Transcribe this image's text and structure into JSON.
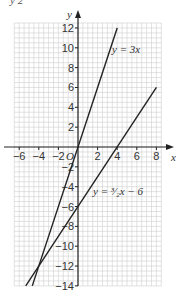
{
  "header_fragment": "y   2",
  "chart_data": {
    "type": "line",
    "title": "",
    "xlabel": "x",
    "ylabel": "y",
    "xlim": [
      -6,
      8.5
    ],
    "ylim": [
      -14,
      12.5
    ],
    "grid": true,
    "x_ticks": [
      -6,
      -4,
      -2,
      2,
      4,
      6,
      8
    ],
    "y_ticks": [
      12,
      10,
      8,
      6,
      4,
      2,
      -2,
      -4,
      -6,
      -8,
      -10,
      -12,
      -14
    ],
    "origin_label": "O",
    "series": [
      {
        "name": "y = 3x",
        "label": "y = 3x",
        "slope": 3,
        "intercept": 0,
        "x": [
          -4.667,
          4
        ],
        "y": [
          -14,
          12
        ]
      },
      {
        "name": "y = 3/2 x − 6",
        "label": "y = ³⁄₂x − 6",
        "slope": 1.5,
        "intercept": -6,
        "x": [
          -5.333,
          8
        ],
        "y": [
          -14,
          6
        ]
      }
    ],
    "intersection": {
      "x": -4,
      "y": -12
    }
  }
}
